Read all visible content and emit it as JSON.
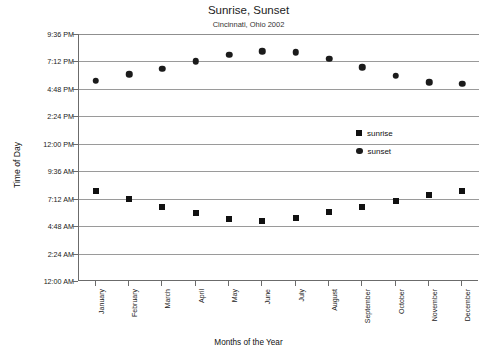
{
  "chart_data": {
    "type": "scatter",
    "title": "Sunrise, Sunset",
    "subtitle": "Cincinnati, Ohio 2002",
    "xlabel": "Months of the Year",
    "ylabel": "Time of Day",
    "grid": true,
    "legend_position": "center-right",
    "categories": [
      "January",
      "February",
      "March",
      "April",
      "May",
      "June",
      "July",
      "August",
      "September",
      "October",
      "November",
      "December"
    ],
    "ytick_labels": [
      "12:00 AM",
      "2:24 AM",
      "4:48 AM",
      "7:12 AM",
      "9:36 AM",
      "12:00 PM",
      "2:24 PM",
      "4:48 PM",
      "7:12 PM",
      "9:36 PM"
    ],
    "ytick_values": [
      0,
      2.4,
      4.8,
      7.2,
      9.6,
      12,
      14.4,
      16.8,
      19.2,
      21.6
    ],
    "ylim": [
      0,
      21.6
    ],
    "series": [
      {
        "name": "sunrise",
        "marker": "square",
        "color": "#111111",
        "value_labels": [
          "7:53 AM",
          "7:12 AM",
          "6:29 AM",
          "5:58 AM",
          "5:24 AM",
          "5:15 AM",
          "5:30 AM",
          "6:00 AM",
          "6:29 AM",
          "6:59 AM",
          "7:32 AM",
          "7:53 AM"
        ],
        "values": [
          7.88,
          7.2,
          6.48,
          5.97,
          5.4,
          5.25,
          5.5,
          6.0,
          6.48,
          6.98,
          7.53,
          7.88
        ]
      },
      {
        "name": "sunset",
        "marker": "circle",
        "color": "#1b1b1b",
        "value_labels": [
          "5:31 PM",
          "6:04 PM",
          "6:35 PM",
          "7:12 PM",
          "7:46 PM",
          "8:05 PM",
          "8:01 PM",
          "7:25 PM",
          "6:41 PM",
          "5:58 PM",
          "5:22 PM",
          "5:15 PM"
        ],
        "values": [
          17.52,
          18.07,
          18.58,
          19.2,
          19.77,
          20.08,
          20.02,
          19.42,
          18.68,
          17.97,
          17.37,
          17.25
        ]
      }
    ]
  }
}
